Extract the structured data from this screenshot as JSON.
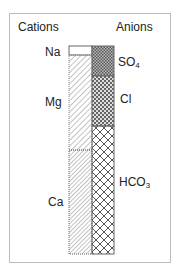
{
  "headers": {
    "cations": "Cations",
    "anions": "Anions"
  },
  "cations": [
    {
      "label": "Na",
      "top": 46,
      "bottom": 55,
      "pattern": "blank"
    },
    {
      "label": "Mg",
      "top": 55,
      "bottom": 150,
      "pattern": "hatch-light"
    },
    {
      "label": "Ca",
      "top": 150,
      "bottom": 254,
      "pattern": "hatch-dense"
    }
  ],
  "anions": [
    {
      "label": "SO",
      "sub": "4",
      "top": 46,
      "bottom": 76,
      "pattern": "dense-check"
    },
    {
      "label": "Cl",
      "top": 76,
      "bottom": 126,
      "pattern": "check"
    },
    {
      "label": "HCO",
      "sub": "3",
      "top": 126,
      "bottom": 254,
      "pattern": "crosshatch"
    }
  ]
}
